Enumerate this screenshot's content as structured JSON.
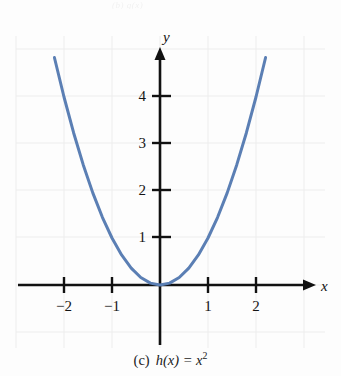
{
  "figure": {
    "caption_label": "(c)",
    "caption_function_head": "h(x) = x",
    "caption_exponent": "2",
    "top_remnant_text": "(b) g(x)",
    "background_color": "#fdfdfd",
    "curve_color": "#5B7FB4",
    "axis_color": "#111111",
    "grid_color": "#ececec"
  },
  "chart_data": {
    "type": "line",
    "subtitle": "",
    "function": "h(x) = x^2",
    "xlabel": "x",
    "ylabel": "y",
    "xlim": [
      -2.95,
      3.1
    ],
    "ylim": [
      -1.15,
      4.95
    ],
    "xticks": [
      -2,
      -1,
      1,
      2
    ],
    "xtick_labels": [
      "−2",
      "−1",
      "1",
      "2"
    ],
    "yticks": [
      1,
      2,
      3,
      4
    ],
    "ytick_labels": [
      "1",
      "2",
      "3",
      "4"
    ],
    "grid": true,
    "grid_style": "faint light-gray square grid",
    "legend": null,
    "legend_position": "none",
    "axis_arrows": [
      "x-positive",
      "y-positive"
    ],
    "series": [
      {
        "name": "h(x) = x^2",
        "color": "#5B7FB4",
        "linewidth": 3,
        "x": [
          -2.2,
          -2.0,
          -1.8,
          -1.6,
          -1.4,
          -1.2,
          -1.0,
          -0.8,
          -0.6,
          -0.4,
          -0.2,
          0.0,
          0.2,
          0.4,
          0.6,
          0.8,
          1.0,
          1.2,
          1.4,
          1.6,
          1.8,
          2.0,
          2.2
        ],
        "y": [
          4.84,
          4.0,
          3.24,
          2.56,
          1.96,
          1.44,
          1.0,
          0.64,
          0.36,
          0.16,
          0.04,
          0.0,
          0.04,
          0.16,
          0.36,
          0.64,
          1.0,
          1.44,
          1.96,
          2.56,
          3.24,
          4.0,
          4.84
        ]
      }
    ],
    "annotations": [
      {
        "text": "y",
        "role": "y-axis-name"
      },
      {
        "text": "x",
        "role": "x-axis-name"
      }
    ]
  }
}
